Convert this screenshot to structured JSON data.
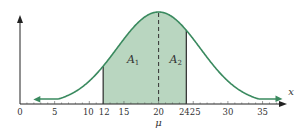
{
  "chart_data": {
    "type": "area",
    "title": "",
    "xlabel": "x",
    "ylabel": "",
    "xlim": [
      0,
      38
    ],
    "x_ticks": [
      0,
      5,
      10,
      12,
      15,
      20,
      24,
      25,
      30,
      35
    ],
    "x_tick_labels": [
      "0",
      "5",
      "10",
      "12",
      "15",
      "20",
      "24",
      "25",
      "30",
      "35"
    ],
    "mean": 20,
    "mean_label": "μ",
    "sigma_estimate": 6,
    "shaded_region": {
      "from": 12,
      "to": 24,
      "split_at": 20
    },
    "areas": [
      {
        "name": "A1",
        "label": "A",
        "subscript": "1",
        "from": 12,
        "to": 20
      },
      {
        "name": "A2",
        "label": "A",
        "subscript": "2",
        "from": 20,
        "to": 24
      }
    ],
    "grid": false,
    "colors": {
      "curve": "#3a8a5f",
      "fill": "#b9d6c0",
      "axis": "#222222",
      "boundary": "#2a2a2a"
    }
  }
}
